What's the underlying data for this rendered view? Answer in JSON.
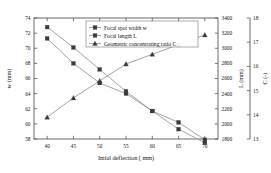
{
  "chart_data": {
    "type": "line",
    "title": "",
    "xlabel": "Intial deflection ( mm)",
    "ylabel": "w (mm)",
    "ylabel2": "L (mm)",
    "ylabel3": "C (-)",
    "x": [
      40,
      45,
      50,
      55,
      60,
      65,
      70
    ],
    "xlim": [
      37.5,
      72.5
    ],
    "xticks": [
      "40",
      "45",
      "50",
      "55",
      "60",
      "65",
      "70"
    ],
    "grid": false,
    "legend_position": "top-center",
    "series": [
      {
        "name": "Focal spot width w",
        "axis": "left",
        "marker": "square",
        "color": "#3a3a3a",
        "values": [
          71.3,
          68.0,
          65.4,
          64.0,
          61.7,
          60.2,
          57.9
        ]
      },
      {
        "name": "Focal length L",
        "axis": "right-1",
        "marker": "square",
        "color": "#3a3a3a",
        "values": [
          3280,
          3010,
          2720,
          2430,
          2170,
          1930,
          1750
        ]
      },
      {
        "name": "Geometric concentrating ratio C",
        "axis": "right-2",
        "marker": "triangle",
        "color": "#3a3a3a",
        "values": [
          13.9,
          14.7,
          15.4,
          16.1,
          16.5,
          16.9,
          17.3
        ]
      }
    ],
    "left_axis": {
      "label": "w (mm)",
      "lim": [
        58,
        74
      ],
      "ticks": [
        "58",
        "60",
        "62",
        "64",
        "66",
        "68",
        "70",
        "72",
        "74"
      ],
      "tickvals": [
        58,
        60,
        62,
        64,
        66,
        68,
        70,
        72,
        74
      ]
    },
    "right_axis_1": {
      "label": "L (mm)",
      "lim": [
        1800,
        3400
      ],
      "ticks": [
        "1800",
        "2000",
        "2200",
        "2400",
        "2600",
        "2800",
        "3000",
        "3200",
        "3400"
      ],
      "tickvals": [
        1800,
        2000,
        2200,
        2400,
        2600,
        2800,
        3000,
        3200,
        3400
      ]
    },
    "right_axis_2": {
      "label": "C (-)",
      "lim": [
        13,
        18
      ],
      "ticks": [
        "13",
        "14",
        "15",
        "16",
        "17",
        "18"
      ],
      "tickvals": [
        13,
        14,
        15,
        16,
        17,
        18
      ]
    },
    "legend": [
      "Focal spot width w",
      "Focal length L",
      "Geometric concentrating ratio C"
    ]
  }
}
